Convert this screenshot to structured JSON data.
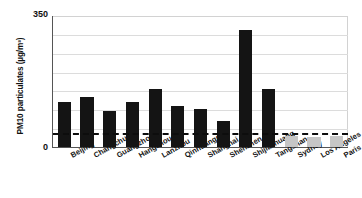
{
  "chart_data": {
    "type": "bar",
    "title": "",
    "xlabel": "",
    "ylabel": "PM10 particulates (µg/m³)",
    "ylim": [
      0,
      350
    ],
    "yticks": [
      0,
      350
    ],
    "ytick_labels": [
      "0",
      "350"
    ],
    "grid": true,
    "gridline_values": [
      50,
      100,
      150,
      200,
      250,
      300
    ],
    "legend": "none",
    "categories": [
      "Beijing",
      "Changchun",
      "Guangzhou",
      "Hangzhou",
      "Lanzhou",
      "Qinhuangdao",
      "Shanghai",
      "Shenzhen",
      "Shijiazhuang",
      "Tangshan",
      "Sydney",
      "Los Angeles",
      "Paris"
    ],
    "values": [
      120,
      133,
      95,
      120,
      155,
      108,
      100,
      70,
      310,
      155,
      28,
      26,
      30
    ],
    "bar_colors": [
      "#141414",
      "#141414",
      "#141414",
      "#141414",
      "#141414",
      "#141414",
      "#141414",
      "#141414",
      "#141414",
      "#141414",
      "#c6c6c6",
      "#c6c6c6",
      "#c6c6c6"
    ],
    "reference_line": {
      "value": 40,
      "style": "dashed",
      "color": "#0d0d0d"
    },
    "axis_color": "#555555",
    "grid_color": "#dcdcdc"
  },
  "yaxis": {
    "max_label": "350",
    "min_label": "0",
    "title": "PM10 particulates (µg/m³)"
  }
}
